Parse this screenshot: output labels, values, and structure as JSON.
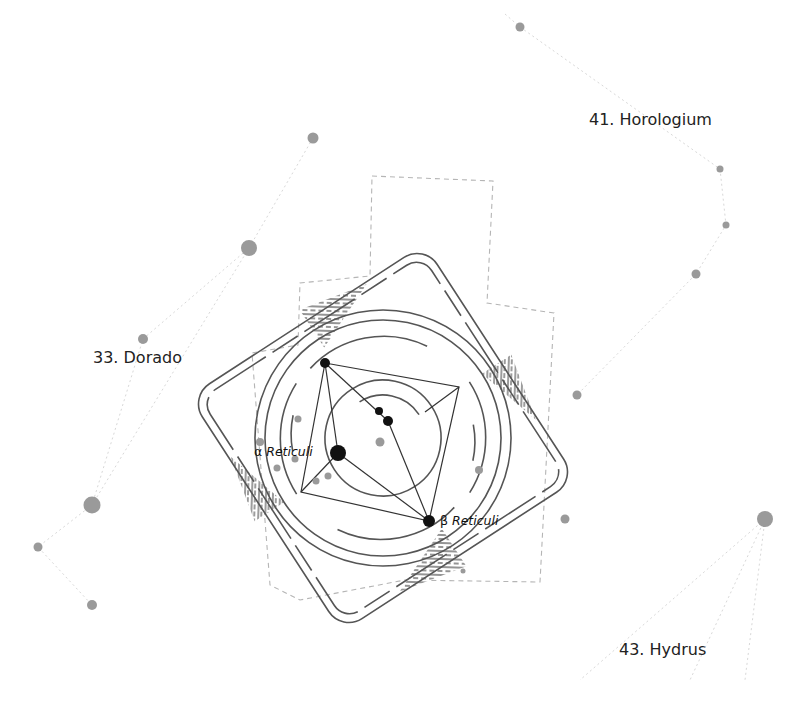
{
  "colors": {
    "background": "#ffffff",
    "line": "#555555",
    "faint_line": "#d8d8d8",
    "boundary": "#b5b5b5",
    "star_main": "#111111",
    "star_neighbor": "#9a9a9a",
    "hatch": "#666666"
  },
  "constellation_labels": [
    {
      "id": "dorado",
      "text": "33. Dorado",
      "x": 93,
      "y": 348
    },
    {
      "id": "horologium",
      "text": "41. Horologium",
      "x": 589,
      "y": 110
    },
    {
      "id": "hydrus",
      "text": "43. Hydrus",
      "x": 619,
      "y": 640
    }
  ],
  "star_labels": [
    {
      "id": "alpha-reticuli",
      "greek": "α",
      "name": "Reticuli",
      "x": 254,
      "y": 444
    },
    {
      "id": "beta-reticuli",
      "greek": "β",
      "name": "Reticuli",
      "x": 440,
      "y": 513
    }
  ],
  "main_stars": [
    {
      "name": "alpha",
      "x": 338,
      "y": 453,
      "r": 8
    },
    {
      "name": "beta",
      "x": 429,
      "y": 521,
      "r": 6
    },
    {
      "name": "top",
      "x": 325,
      "y": 363,
      "r": 5
    },
    {
      "name": "mid1",
      "x": 379,
      "y": 411,
      "r": 4
    },
    {
      "name": "mid2",
      "x": 388,
      "y": 421,
      "r": 5
    }
  ],
  "neighbor_stars": [
    {
      "x": 520,
      "y": 27,
      "r": 4.5
    },
    {
      "x": 313,
      "y": 138,
      "r": 5.5
    },
    {
      "x": 249,
      "y": 248,
      "r": 8
    },
    {
      "x": 143,
      "y": 339,
      "r": 5
    },
    {
      "x": 92,
      "y": 505,
      "r": 8.5
    },
    {
      "x": 38,
      "y": 547,
      "r": 4.5
    },
    {
      "x": 92,
      "y": 605,
      "r": 5
    },
    {
      "x": 720,
      "y": 169,
      "r": 3.5
    },
    {
      "x": 726,
      "y": 225,
      "r": 3.5
    },
    {
      "x": 696,
      "y": 274,
      "r": 4.5
    },
    {
      "x": 577,
      "y": 395,
      "r": 4.5
    },
    {
      "x": 565,
      "y": 519,
      "r": 4.5
    },
    {
      "x": 765,
      "y": 519,
      "r": 8
    },
    {
      "x": 463,
      "y": 571,
      "r": 2.5
    },
    {
      "x": 380,
      "y": 442,
      "r": 4.5
    },
    {
      "x": 298,
      "y": 419,
      "r": 3.5
    },
    {
      "x": 260,
      "y": 442,
      "r": 4
    },
    {
      "x": 295,
      "y": 459,
      "r": 3.5
    },
    {
      "x": 277,
      "y": 468,
      "r": 3.5
    },
    {
      "x": 316,
      "y": 481,
      "r": 3.5
    },
    {
      "x": 328,
      "y": 476,
      "r": 3.5
    },
    {
      "x": 479,
      "y": 470,
      "r": 4
    }
  ]
}
